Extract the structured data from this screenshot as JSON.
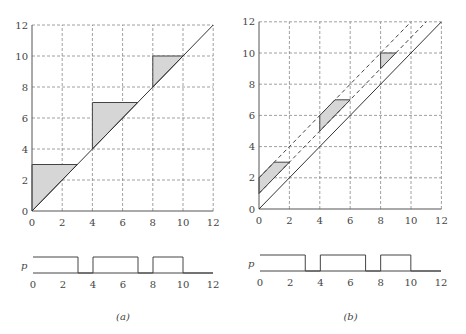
{
  "figure": {
    "panels": [
      {
        "id": "a",
        "caption": "(a)",
        "axes": {
          "xmin": 0,
          "xmax": 12,
          "ymin": 0,
          "ymax": 12,
          "ticks": [
            0,
            2,
            4,
            6,
            8,
            10,
            12
          ]
        },
        "origin_px": [
          32,
          211
        ],
        "scale_px": [
          15.1,
          15.5
        ],
        "diagonal": [
          [
            0,
            0
          ],
          [
            12,
            12
          ]
        ],
        "dashed_lines": [],
        "shaded_regions": [
          [
            [
              0,
              0
            ],
            [
              0,
              3
            ],
            [
              3,
              3
            ]
          ],
          [
            [
              4,
              4
            ],
            [
              4,
              7
            ],
            [
              7,
              7
            ]
          ],
          [
            [
              8,
              8
            ],
            [
              8,
              10
            ],
            [
              10,
              10
            ]
          ]
        ],
        "signal": {
          "label": "p",
          "x0_px": 33,
          "x12_px": 213,
          "high_px": 257,
          "low_px": 273,
          "high_intervals": [
            [
              0,
              3
            ],
            [
              4,
              7
            ],
            [
              8,
              10
            ]
          ]
        }
      },
      {
        "id": "b",
        "caption": "(b)",
        "axes": {
          "xmin": 0,
          "xmax": 12,
          "ymin": 0,
          "ymax": 12,
          "ticks": [
            0,
            2,
            4,
            6,
            8,
            10,
            12
          ]
        },
        "origin_px": [
          259,
          209
        ],
        "scale_px": [
          15.2,
          15.6
        ],
        "diagonal": [
          [
            0,
            0
          ],
          [
            12,
            12
          ]
        ],
        "dashed_lines": [
          [
            [
              0,
              1
            ],
            [
              11,
              12
            ]
          ],
          [
            [
              0,
              2
            ],
            [
              10,
              12
            ]
          ]
        ],
        "shaded_regions": [
          [
            [
              0,
              1
            ],
            [
              0,
              2
            ],
            [
              1,
              3
            ],
            [
              2,
              3
            ]
          ],
          [
            [
              4,
              5
            ],
            [
              4,
              6
            ],
            [
              5,
              7
            ],
            [
              6,
              7
            ]
          ],
          [
            [
              8,
              9
            ],
            [
              8,
              10
            ],
            [
              9,
              10
            ]
          ]
        ],
        "signal": {
          "label": "p",
          "x0_px": 260,
          "x12_px": 441,
          "high_px": 255,
          "low_px": 271,
          "high_intervals": [
            [
              0,
              3
            ],
            [
              4,
              7
            ],
            [
              8,
              10
            ]
          ]
        }
      }
    ]
  },
  "colors": {
    "shade": "#d6d6d6",
    "line": "#333333",
    "grid": "#888888"
  }
}
